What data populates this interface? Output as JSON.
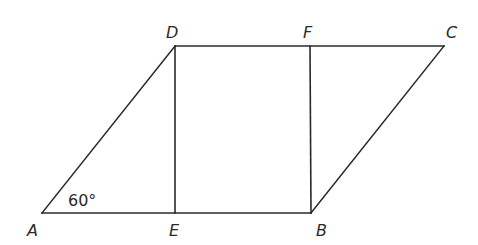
{
  "diagram": {
    "type": "geometry-figure",
    "vertices": {
      "A": {
        "label": "A",
        "x": 42,
        "y": 213,
        "label_x": 27,
        "label_y": 236
      },
      "B": {
        "label": "B",
        "x": 311,
        "y": 213,
        "label_x": 316,
        "label_y": 236
      },
      "C": {
        "label": "C",
        "x": 444,
        "y": 46,
        "label_x": 446,
        "label_y": 38
      },
      "D": {
        "label": "D",
        "x": 175,
        "y": 46,
        "label_x": 166,
        "label_y": 38
      },
      "E": {
        "label": "E",
        "x": 175,
        "y": 213,
        "label_x": 169,
        "label_y": 236
      },
      "F": {
        "label": "F",
        "x": 310,
        "y": 46,
        "label_x": 303,
        "label_y": 38
      }
    },
    "segments": [
      {
        "name": "AB",
        "from": "A",
        "to": "B"
      },
      {
        "name": "BC",
        "from": "B",
        "to": "C"
      },
      {
        "name": "CD",
        "from": "C",
        "to": "D"
      },
      {
        "name": "DA",
        "from": "D",
        "to": "A"
      },
      {
        "name": "DE",
        "from": "D",
        "to": "E"
      },
      {
        "name": "FB",
        "from": "F",
        "to": "B"
      }
    ],
    "angle_annotation": {
      "vertex": "A",
      "text": "60°",
      "x": 68,
      "y": 206
    },
    "colors": {
      "stroke": "#2a2a2a",
      "background": "#ffffff"
    }
  }
}
